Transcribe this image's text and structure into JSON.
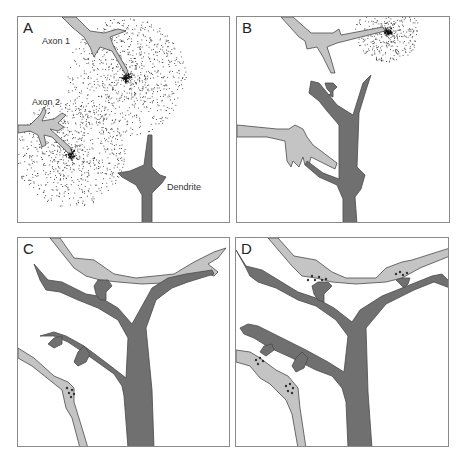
{
  "figure": {
    "panels": [
      {
        "id": "A",
        "label": "A",
        "annotations": {
          "axon1": "Axon 1",
          "axon2": "Axon 2",
          "dendrite": "Dendrite"
        }
      },
      {
        "id": "B",
        "label": "B"
      },
      {
        "id": "C",
        "label": "C"
      },
      {
        "id": "D",
        "label": "D"
      }
    ],
    "colors": {
      "axon_fill": "#c4c4c4",
      "dendrite_fill": "#707070",
      "outline": "#4a4a4a",
      "diffusion_dots": "#333333",
      "border": "#8a8a8a"
    }
  }
}
